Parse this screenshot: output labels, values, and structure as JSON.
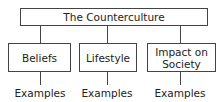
{
  "root": {
    "label": "The Counterculture"
  },
  "children": [
    {
      "label": "Beliefs",
      "leaf": "Examples"
    },
    {
      "label": "Lifestyle",
      "leaf": "Examples"
    },
    {
      "label": "Impact on Society",
      "leaf": "Examples"
    }
  ]
}
